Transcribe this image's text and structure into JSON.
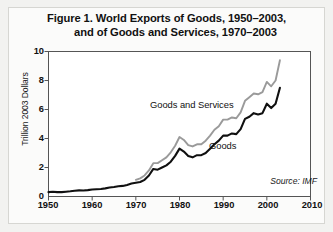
{
  "figure": {
    "title_line_1": "Figure 1. World Exports of Goods, 1950–2003,",
    "title_line_2": "and of Goods and Services, 1970–2003",
    "source": "Source: IMF"
  },
  "chart_data": {
    "type": "line",
    "title": "Figure 1. World Exports of Goods, 1950–2003, and of Goods and Services, 1970–2003",
    "xlabel": "",
    "ylabel": "Trillion 2003 Dollars",
    "xlim": [
      1950,
      2010
    ],
    "ylim": [
      0,
      10
    ],
    "xticks": [
      1950,
      1960,
      1970,
      1980,
      1990,
      2000,
      2010
    ],
    "yticks": [
      0,
      2,
      4,
      6,
      8,
      10
    ],
    "grid": false,
    "legend": "inline-labels",
    "colors": {
      "goods": "#101010",
      "goods_and_services": "#9a9a9a",
      "axis": "#555555",
      "frame": "#d6d6d2",
      "panel_background": "#fbfbfa",
      "page_background": "#f2f2f0"
    },
    "series": [
      {
        "name": "Goods and Services",
        "color": "#9a9a9a",
        "label_x": 1976,
        "label_y": 6.3,
        "x": [
          1970,
          1971,
          1972,
          1973,
          1974,
          1975,
          1976,
          1977,
          1978,
          1979,
          1980,
          1981,
          1982,
          1983,
          1984,
          1985,
          1986,
          1987,
          1988,
          1989,
          1990,
          1991,
          1992,
          1993,
          1994,
          1995,
          1996,
          1997,
          1998,
          1999,
          2000,
          2001,
          2002,
          2003
        ],
        "values": [
          1.15,
          1.25,
          1.45,
          1.8,
          2.3,
          2.3,
          2.5,
          2.7,
          3.05,
          3.5,
          4.1,
          3.9,
          3.55,
          3.45,
          3.6,
          3.6,
          3.85,
          4.2,
          4.6,
          4.85,
          5.3,
          5.3,
          5.45,
          5.4,
          5.8,
          6.6,
          6.85,
          7.1,
          7.05,
          7.2,
          7.9,
          7.6,
          8.0,
          9.4
        ]
      },
      {
        "name": "Goods",
        "color": "#101010",
        "label_x": 1989,
        "label_y": 3.6,
        "x": [
          1950,
          1951,
          1952,
          1953,
          1954,
          1955,
          1956,
          1957,
          1958,
          1959,
          1960,
          1961,
          1962,
          1963,
          1964,
          1965,
          1966,
          1967,
          1968,
          1969,
          1970,
          1971,
          1972,
          1973,
          1974,
          1975,
          1976,
          1977,
          1978,
          1979,
          1980,
          1981,
          1982,
          1983,
          1984,
          1985,
          1986,
          1987,
          1988,
          1989,
          1990,
          1991,
          1992,
          1993,
          1994,
          1995,
          1996,
          1997,
          1998,
          1999,
          2000,
          2001,
          2002,
          2003
        ],
        "values": [
          0.3,
          0.33,
          0.3,
          0.3,
          0.33,
          0.36,
          0.4,
          0.42,
          0.41,
          0.44,
          0.48,
          0.5,
          0.52,
          0.56,
          0.62,
          0.66,
          0.71,
          0.73,
          0.8,
          0.9,
          0.95,
          1.0,
          1.15,
          1.45,
          1.9,
          1.85,
          2.0,
          2.15,
          2.4,
          2.8,
          3.3,
          3.1,
          2.8,
          2.7,
          2.85,
          2.85,
          3.0,
          3.3,
          3.6,
          3.85,
          4.2,
          4.2,
          4.35,
          4.3,
          4.65,
          5.35,
          5.5,
          5.75,
          5.65,
          5.75,
          6.4,
          6.1,
          6.4,
          7.5
        ]
      }
    ]
  },
  "axis": {
    "y_tick_labels": [
      "0",
      "2",
      "4",
      "6",
      "8",
      "10"
    ],
    "x_tick_labels": [
      "1950",
      "1960",
      "1970",
      "1980",
      "1990",
      "2000",
      "2010"
    ]
  }
}
